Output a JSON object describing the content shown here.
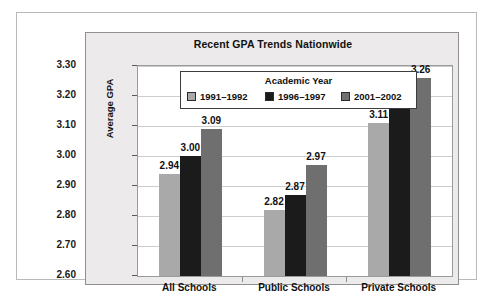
{
  "chart_data": {
    "type": "bar",
    "title": "Recent GPA Trends Nationwide",
    "xlabel": "",
    "ylabel": "Average GPA",
    "ylim": [
      2.6,
      3.3
    ],
    "ytick_labels": [
      "3.30",
      "3.20",
      "3.10",
      "3.00",
      "2.90",
      "2.80",
      "2.70",
      "2.60"
    ],
    "yticks": [
      3.3,
      3.2,
      3.1,
      3.0,
      2.9,
      2.8,
      2.7,
      2.6
    ],
    "grid": true,
    "legend_position": "upper-left-inside",
    "legend_title": "Academic Year",
    "categories": [
      "All Schools",
      "Public Schools",
      "Private Schools"
    ],
    "series": [
      {
        "name": "1991–1992",
        "color": "#a9a9a9",
        "values": [
          2.94,
          2.82,
          3.11
        ],
        "labels": [
          "2.94",
          "2.82",
          "3.11"
        ]
      },
      {
        "name": "1996–1997",
        "color": "#1b1b1b",
        "values": [
          3.0,
          2.87,
          3.19
        ],
        "labels": [
          "3.00",
          "2.87",
          "3.19"
        ]
      },
      {
        "name": "2001–2002",
        "color": "#6f6f6f",
        "values": [
          3.09,
          2.97,
          3.26
        ],
        "labels": [
          "3.09",
          "2.97",
          "3.26"
        ]
      }
    ]
  },
  "colors": {
    "panel_background": "#eceaea",
    "plot_background": "#ffffff",
    "gridline": "#cdcdcd",
    "axis": "#5a5a5a",
    "text": "#111111",
    "series_1991": "#a9a9a9",
    "series_1996": "#1b1b1b",
    "series_2001": "#6f6f6f"
  }
}
